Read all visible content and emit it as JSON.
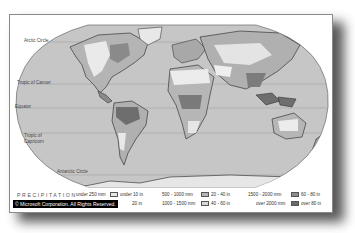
{
  "map": {
    "title": "PRECIPITATION",
    "copyright": "© Microsoft Corporation. All Rights Reserved.",
    "latitude_labels": {
      "arctic": "Arctic Circle",
      "cancer": "Tropic of Cancer",
      "equator": "Equator",
      "capricorn_1": "Tropic of",
      "capricorn_2": "Capricorn",
      "antarctic": "Antarctic Circle"
    },
    "colors": {
      "ocean": "#c8c8c8",
      "land_dry": "#e8e8e8",
      "land_mid": "#b0b0b0",
      "land_wet": "#808080",
      "land_wettest": "#5a5a5a",
      "coast": "#222222"
    }
  },
  "legend": {
    "items": [
      {
        "mm": "under 250 mm",
        "in": "under 10 in",
        "color": "#e6e6e6"
      },
      {
        "mm": "250 - 500 mm",
        "in": "10 - 20 in",
        "color": "#d2d2d2"
      },
      {
        "mm": "500 - 1000 mm",
        "in": "20 - 40 in",
        "color": "#b4b4b4"
      },
      {
        "mm": "1000 - 1500 mm",
        "in": "40 - 60 in",
        "color": "#c8c8c8"
      },
      {
        "mm": "1500 - 2000 mm",
        "in": "60 - 80 in",
        "color": "#8c8c8c"
      },
      {
        "mm": "over 2000 mm",
        "in": "over 80 in",
        "color": "#6a6a6a"
      }
    ],
    "visible_in_suffix_row2_1": "20 in"
  }
}
